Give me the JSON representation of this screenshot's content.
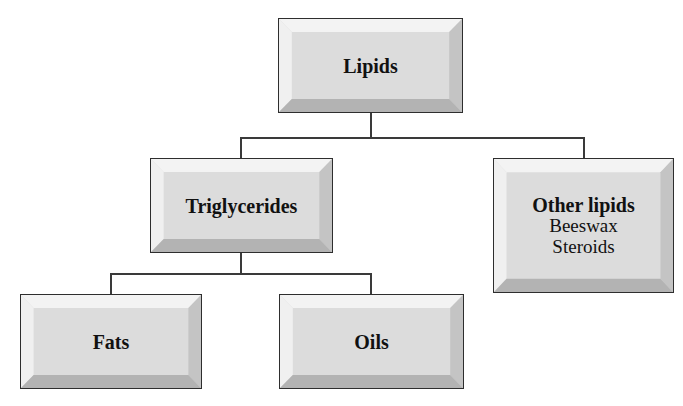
{
  "diagram": {
    "type": "hierarchy",
    "root": {
      "label": "Lipids",
      "children": [
        {
          "label": "Triglycerides",
          "children": [
            {
              "label": "Fats"
            },
            {
              "label": "Oils"
            }
          ]
        },
        {
          "label": "Other lipids",
          "items": [
            "Beeswax",
            "Steroids"
          ]
        }
      ]
    }
  },
  "nodes": {
    "lipids": {
      "title": "Lipids"
    },
    "triglycerides": {
      "title": "Triglycerides"
    },
    "other_lipids": {
      "title": "Other lipids",
      "items": [
        "Beeswax",
        "Steroids"
      ]
    },
    "fats": {
      "title": "Fats"
    },
    "oils": {
      "title": "Oils"
    }
  },
  "colors": {
    "face": "#dcdcdc",
    "bevel_light": "#f2f2f2",
    "bevel_dark": "#b3b3b3",
    "border": "#2e2e2e",
    "connector": "#3a3a3a"
  }
}
